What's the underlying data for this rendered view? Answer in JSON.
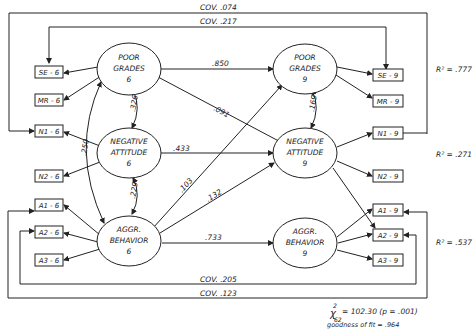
{
  "latent": {
    "pg6": {
      "l1": "POOR",
      "l2": "GRADES",
      "l3": "6"
    },
    "na6": {
      "l1": "NEGATIVE",
      "l2": "ATTITUDE",
      "l3": "6"
    },
    "ab6": {
      "l1": "AGGR.",
      "l2": "BEHAVIOR",
      "l3": "6"
    },
    "pg9": {
      "l1": "POOR",
      "l2": "GRADES",
      "l3": "9"
    },
    "na9": {
      "l1": "NEGATIVE",
      "l2": "ATTITUDE",
      "l3": "9"
    },
    "ab9": {
      "l1": "AGGR.",
      "l2": "BEHAVIOR",
      "l3": "9"
    }
  },
  "indicators": {
    "se6": "SE - 6",
    "mr6": "MR - 6",
    "n16": "N1 - 6",
    "n26": "N2 - 6",
    "a16": "A1 - 6",
    "a26": "A2 - 6",
    "a36": "A3 - 6",
    "se9": "SE - 9",
    "mr9": "MR - 9",
    "n19": "N1 - 9",
    "n29": "N2 - 9",
    "a19": "A1 - 9",
    "a29": "A2 - 9",
    "a39": "A3 - 9"
  },
  "paths": {
    "pg6_pg9": ".850",
    "pg6_na9": ".091",
    "na6_na9": ".433",
    "ab6_pg9": ".103",
    "ab6_na9": ".132",
    "ab6_ab9": ".733",
    "pg6_na6": ".326",
    "na6_ab6": ".229",
    "pg6_ab6": ".250",
    "pg9_na9": ".169"
  },
  "covariances": {
    "top1": "COV. .074",
    "top2": "COV. .217",
    "bot1": "COV. .205",
    "bot2": "COV. .123"
  },
  "r_squared": {
    "pg9": "R² = .777",
    "na9": "R² = .271",
    "ab9": "R² = .537"
  },
  "fit": {
    "chi_symbol": "χ",
    "chi_sup": "2",
    "chi_sub": "62",
    "chi_value": "= 102.30 (p = .001)",
    "gof": "goodness of fit = .964"
  }
}
